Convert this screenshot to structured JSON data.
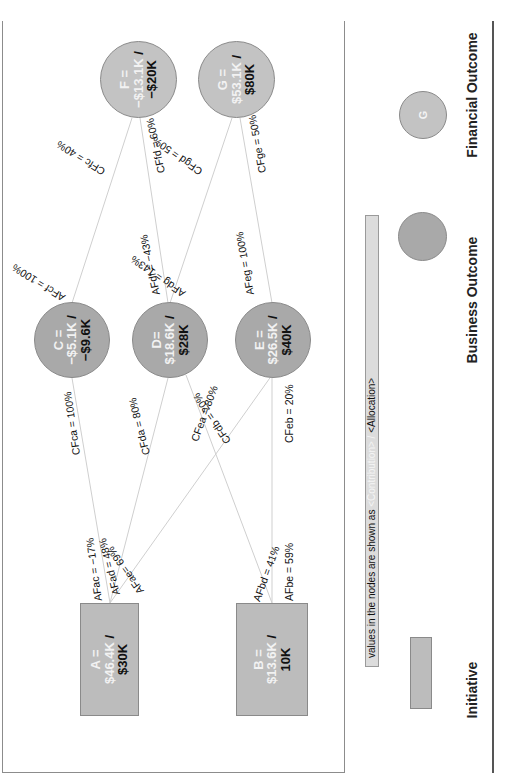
{
  "legend": {
    "note_prefix": "values in the nodes are shown as ",
    "note_contribution": "<Contribution>",
    "note_sep": " / ",
    "note_allocation": "<Allocation>",
    "initiative_label": "Initiative",
    "business_label": "Business Outcome",
    "financial_label": "Financial Outcome",
    "financial_symbol": "G"
  },
  "nodes": {
    "A": {
      "line1": "A =",
      "line2": "$46.4K",
      "sep": " /",
      "line3": "$30K",
      "type": "initiative"
    },
    "B": {
      "line1": "B =",
      "line2": "$13.6K",
      "sep": " /",
      "line3": "10K",
      "type": "initiative"
    },
    "C": {
      "line1": "C =",
      "line2": "−$5.1K",
      "sep": " /",
      "line3": "−$9.6K",
      "type": "business"
    },
    "D": {
      "line1": "D=",
      "line2": "$18.6K",
      "sep": " /",
      "line3": "$28K",
      "type": "business"
    },
    "E": {
      "line1": "E =",
      "line2": "$26.5K",
      "sep": " /",
      "line3": "$40K",
      "type": "business"
    },
    "F": {
      "line1": "F =",
      "line2": "−$13.1K",
      "sep": " /",
      "line3": "−$20K",
      "type": "financial"
    },
    "G": {
      "line1": "G =",
      "line2": "$53.1K",
      "sep": " /",
      "line3": "$80K",
      "type": "financial"
    }
  },
  "edges": [
    {
      "from": "A",
      "to": "C",
      "af": "AFac = −17%",
      "cf": "CFca = 100%"
    },
    {
      "from": "A",
      "to": "D",
      "af": "AFad = 48%",
      "cf": "CFda = 80%"
    },
    {
      "from": "A",
      "to": "E",
      "af": "AFae= 69%",
      "cf": "CFea = 80%"
    },
    {
      "from": "B",
      "to": "D",
      "af": "AFbd = 41%",
      "cf": "CFdb = 20%"
    },
    {
      "from": "B",
      "to": "E",
      "af": "AFbe = 59%",
      "cf": "CFeb = 20%"
    },
    {
      "from": "C",
      "to": "F",
      "af": "AFcf = 100%",
      "cf": "CFfc = 40%"
    },
    {
      "from": "D",
      "to": "F",
      "af": "AFdf = −43%",
      "cf": "CFfd = 60%"
    },
    {
      "from": "D",
      "to": "G",
      "af": "AFdg = 143%",
      "cf": "CFgd = 50%"
    },
    {
      "from": "E",
      "to": "G",
      "af": "AFeg = 100%",
      "cf": "CFge = 50%"
    }
  ],
  "colors": {
    "business_fill": "#a9a9a9",
    "financial_fill": "#c3c3c3",
    "initiative_fill": "#bcbcbc",
    "edge_line": "#cfcfcf"
  }
}
